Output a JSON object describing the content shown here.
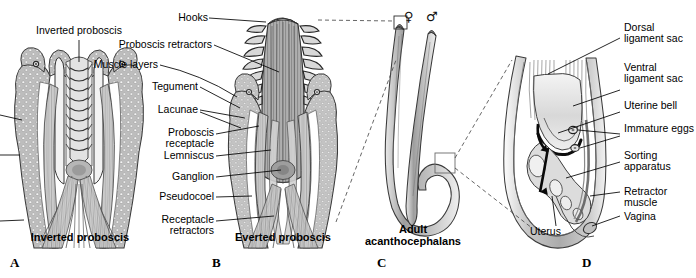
{
  "figure": {
    "title_absent": true,
    "background_color": "#ffffff",
    "ink_color": "#000000"
  },
  "panels": [
    {
      "letter": "A",
      "caption": "Inverted proboscis"
    },
    {
      "letter": "B",
      "caption": "Everted proboscis"
    },
    {
      "letter": "C",
      "caption": "Adult\nacanthocephalans"
    },
    {
      "letter": "D",
      "caption": ""
    }
  ],
  "labels": {
    "panel_a": [
      {
        "text": "Inverted proboscis",
        "align": "center"
      }
    ],
    "panel_b": [
      {
        "text": "Hooks",
        "align": "right"
      },
      {
        "text": "Proboscis retractors",
        "align": "right"
      },
      {
        "text": "Muscle layers",
        "align": "right"
      },
      {
        "text": "Tegument",
        "align": "right"
      },
      {
        "text": "Lacunae",
        "align": "right"
      },
      {
        "text": "Proboscis\nreceptacle",
        "align": "right"
      },
      {
        "text": "Lemniscus",
        "align": "right"
      },
      {
        "text": "Ganglion",
        "align": "right"
      },
      {
        "text": "Pseudocoel",
        "align": "right"
      },
      {
        "text": "Receptacle\nretractors",
        "align": "right"
      }
    ],
    "panel_c": [
      {
        "text": "♀",
        "kind": "female-symbol"
      },
      {
        "text": "♂",
        "kind": "male-symbol"
      }
    ],
    "panel_d": [
      {
        "text": "Dorsal\nligament sac",
        "align": "left"
      },
      {
        "text": "Ventral\nligament sac",
        "align": "left"
      },
      {
        "text": "Uterine bell",
        "align": "left"
      },
      {
        "text": "Immature eggs",
        "align": "left"
      },
      {
        "text": "Sorting\napparatus",
        "align": "left"
      },
      {
        "text": "Retractor\nmuscle",
        "align": "left"
      },
      {
        "text": "Vagina",
        "align": "left"
      },
      {
        "text": "Uterus",
        "align": "left"
      }
    ]
  },
  "label_text": {
    "inverted_proboscis_top": "Inverted proboscis",
    "hooks": "Hooks",
    "proboscis_retractors": "Proboscis retractors",
    "muscle_layers": "Muscle layers",
    "tegument": "Tegument",
    "lacunae": "Lacunae",
    "proboscis_receptacle_1": "Proboscis",
    "proboscis_receptacle_2": "receptacle",
    "lemniscus": "Lemniscus",
    "ganglion": "Ganglion",
    "pseudocoel": "Pseudocoel",
    "receptacle_retractors_1": "Receptacle",
    "receptacle_retractors_2": "retractors",
    "caption_a": "Inverted proboscis",
    "caption_b": "Everted proboscis",
    "caption_c_1": "Adult",
    "caption_c_2": "acanthocephalans",
    "female_symbol": "♀",
    "male_symbol": "♂",
    "dorsal_ligament_sac_1": "Dorsal",
    "dorsal_ligament_sac_2": "ligament sac",
    "ventral_ligament_sac_1": "Ventral",
    "ventral_ligament_sac_2": "ligament sac",
    "uterine_bell": "Uterine bell",
    "immature_eggs": "Immature eggs",
    "sorting_apparatus_1": "Sorting",
    "sorting_apparatus_2": "apparatus",
    "retractor_muscle_1": "Retractor",
    "retractor_muscle_2": "muscle",
    "vagina": "Vagina",
    "uterus": "Uterus",
    "letter_a": "A",
    "letter_b": "B",
    "letter_c": "C",
    "letter_d": "D"
  }
}
